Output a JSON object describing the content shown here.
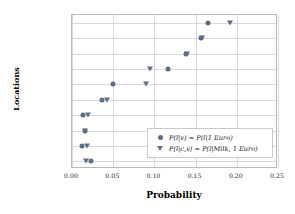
{
  "chart_data": {
    "type": "scatter",
    "title": "",
    "xlabel": "Probability",
    "ylabel": "Locations",
    "xlim": [
      0.0,
      0.25
    ],
    "xticks": [
      "0.00",
      "0.05",
      "0.10",
      "0.15",
      "0.20",
      "0.25"
    ],
    "xtick_values": [
      0.0,
      0.05,
      0.1,
      0.15,
      0.2,
      0.25
    ],
    "grid": true,
    "legend_position": "lower right",
    "categories": [
      "France",
      "Germany",
      "Italy",
      "Spain",
      "China",
      "Netherlands",
      "Vietnam",
      "Belgium",
      "Austria",
      "Greece"
    ],
    "series": [
      {
        "name": "P(l|v) = P(l|1 Euro)",
        "marker": "circle",
        "color": "#5d6d87",
        "values": [
          0.165,
          0.157,
          0.138,
          0.117,
          0.05,
          0.037,
          0.013,
          0.016,
          0.012,
          0.023
        ]
      },
      {
        "name": "P(l|c,v) = P(l|Milk, 1 Euro)",
        "marker": "triangle-down",
        "color": "#5d6d87",
        "values": [
          0.192,
          0.158,
          0.139,
          0.095,
          0.09,
          0.043,
          0.02,
          0.016,
          0.018,
          0.017
        ]
      }
    ]
  },
  "axes": {
    "xlabel": "Probability",
    "ylabel": "Locations"
  },
  "legend": {
    "items": [
      {
        "label": "P(l|v) = P(l|1 Euro)",
        "marker": "circle-marker-icon"
      },
      {
        "label": "P(l|c,v) = P(l|Milk, 1 Euro)",
        "marker": "triangle-marker-icon"
      }
    ]
  }
}
